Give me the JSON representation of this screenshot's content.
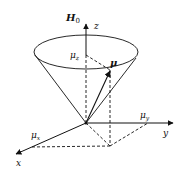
{
  "diagram": {
    "type": "3d-vector-precession",
    "labels": {
      "field": "H",
      "field_sub": "0",
      "z_axis": "z",
      "y_axis": "y",
      "x_axis": "x",
      "mu": "μ",
      "mu_z": "μ",
      "mu_z_sub": "z",
      "mu_y": "μ",
      "mu_y_sub": "y",
      "mu_x": "μ",
      "mu_x_sub": "x"
    },
    "colors": {
      "stroke": "#111111",
      "background": "#ffffff"
    }
  }
}
